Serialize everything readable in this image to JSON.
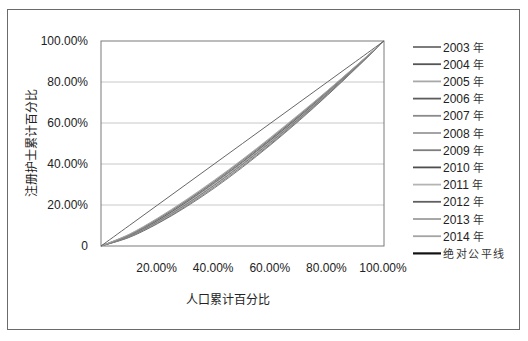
{
  "chart_data": {
    "type": "line",
    "title": "",
    "xlabel": "人口累计百分比",
    "ylabel": "注册护士累计百分比",
    "xlim": [
      0,
      1
    ],
    "ylim": [
      0,
      1
    ],
    "grid": {
      "horizontal": true,
      "vertical": false
    },
    "legend_position": "right",
    "x_tick_labels": [
      "20.00%",
      "40.00%",
      "60.00%",
      "80.00%",
      "100.00%"
    ],
    "y_tick_labels": [
      "0",
      "20.00%",
      "40.00%",
      "60.00%",
      "80.00%",
      "100.00%"
    ],
    "x": [
      0,
      0.1,
      0.2,
      0.3,
      0.4,
      0.5,
      0.6,
      0.7,
      0.8,
      0.9,
      1.0
    ],
    "series": [
      {
        "name": "2003 年",
        "color": "#6e6e6e",
        "values": [
          0,
          0.042,
          0.109,
          0.19,
          0.282,
          0.384,
          0.494,
          0.611,
          0.735,
          0.865,
          1
        ]
      },
      {
        "name": "2004 年",
        "color": "#555555",
        "values": [
          0,
          0.044,
          0.112,
          0.195,
          0.288,
          0.39,
          0.499,
          0.616,
          0.738,
          0.867,
          1
        ]
      },
      {
        "name": "2005 年",
        "color": "#a8a8a8",
        "values": [
          0,
          0.045,
          0.114,
          0.197,
          0.29,
          0.392,
          0.502,
          0.618,
          0.74,
          0.867,
          1
        ]
      },
      {
        "name": "2006 年",
        "color": "#5c5c5c",
        "values": [
          0,
          0.047,
          0.118,
          0.202,
          0.296,
          0.398,
          0.507,
          0.622,
          0.743,
          0.869,
          1
        ]
      },
      {
        "name": "2007 年",
        "color": "#8a8a8a",
        "values": [
          0,
          0.048,
          0.12,
          0.204,
          0.298,
          0.401,
          0.51,
          0.625,
          0.745,
          0.87,
          1
        ]
      },
      {
        "name": "2008 年",
        "color": "#9a9a9a",
        "values": [
          0,
          0.05,
          0.123,
          0.209,
          0.304,
          0.406,
          0.515,
          0.629,
          0.748,
          0.872,
          1
        ]
      },
      {
        "name": "2009 年",
        "color": "#7e7e7e",
        "values": [
          0,
          0.051,
          0.125,
          0.212,
          0.307,
          0.409,
          0.517,
          0.631,
          0.75,
          0.873,
          1
        ]
      },
      {
        "name": "2010 年",
        "color": "#4e4e4e",
        "values": [
          0,
          0.053,
          0.127,
          0.214,
          0.31,
          0.412,
          0.52,
          0.633,
          0.752,
          0.874,
          1
        ]
      },
      {
        "name": "2011 年",
        "color": "#b4b4b4",
        "values": [
          0,
          0.054,
          0.13,
          0.217,
          0.312,
          0.415,
          0.523,
          0.636,
          0.753,
          0.875,
          1
        ]
      },
      {
        "name": "2012 年",
        "color": "#606060",
        "values": [
          0,
          0.055,
          0.132,
          0.219,
          0.315,
          0.418,
          0.525,
          0.638,
          0.755,
          0.876,
          1
        ]
      },
      {
        "name": "2013 年",
        "color": "#9e9e9e",
        "values": [
          0,
          0.056,
          0.134,
          0.222,
          0.318,
          0.42,
          0.528,
          0.64,
          0.757,
          0.877,
          1
        ]
      },
      {
        "name": "2014 年",
        "color": "#a4a4a4",
        "values": [
          0,
          0.058,
          0.136,
          0.225,
          0.321,
          0.423,
          0.531,
          0.643,
          0.758,
          0.878,
          1
        ]
      },
      {
        "name": "绝对公平线",
        "color": "#111111",
        "values": [
          0,
          0.1,
          0.2,
          0.3,
          0.4,
          0.5,
          0.6,
          0.7,
          0.8,
          0.9,
          1
        ]
      }
    ]
  }
}
